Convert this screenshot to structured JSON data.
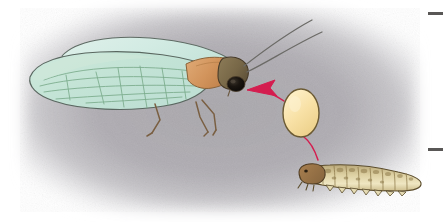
{
  "figure": {
    "kind": "scientific-illustration",
    "caption": "",
    "background": {
      "wash_color": "#aaa8ad",
      "page_color": "#ffffff",
      "shape": "soft-edged rectangular gray wash fading to white at all margins"
    },
    "margin_marks": [
      {
        "name": "upper-edge-dash",
        "x": 428,
        "y": 12,
        "width": 15,
        "height": 3,
        "color": "#3c3a38"
      },
      {
        "name": "lower-edge-dash",
        "x": 428,
        "y": 148,
        "width": 15,
        "height": 3,
        "color": "#3c3a38"
      }
    ]
  },
  "adult_insect": {
    "label": "adult caddisfly",
    "wing": {
      "fill_upper": "#d7ece6",
      "fill_lower": "#c2e3d5",
      "outline": "#5d6a63",
      "vein_color": "#7fae8c",
      "description": "two overlapping elongate pale mint-green wings held tent-like over the body, tip rounded at left"
    },
    "abdomen": {
      "fill": "#9cc0d8",
      "outline": "#6f8fa6",
      "segments": 5,
      "description": "blue-gray segmented abdomen visible through translucent wings"
    },
    "thorax": {
      "fill": "#d79a63",
      "outline": "#8a6238",
      "description": "orange-tan thorax tapering to the head"
    },
    "head": {
      "fill": "#7a6a4a",
      "outline": "#473a28",
      "eye_color": "#15100c",
      "description": "dark olive-brown head with large black compound eye"
    },
    "antennae": {
      "color": "#6b6a66",
      "count": 2,
      "description": "two long slender antennae curving up and to the right"
    },
    "legs": {
      "color": "#7a5f42",
      "count": 3,
      "description": "thin brown jointed legs hanging below the thorax"
    }
  },
  "egg": {
    "label": "egg",
    "fill": "#f7e0a4",
    "outline": "#6b5a33",
    "center_x": 301,
    "center_y": 113,
    "radius_x": 18,
    "radius_y": 24,
    "description": "cream-yellow oval egg with dark brown outline"
  },
  "larva": {
    "label": "larva",
    "body_fill": "#cfc08d",
    "body_highlight": "#efe4bc",
    "mottle_color": "#8e7a4a",
    "head_fill": "#9a7348",
    "outline": "#5b4c2c",
    "segments": 11,
    "description": "elongate segmented caddisfly larva, tan with olive-brown mottling, dark brown head at left, fleshy prolegs along the underside"
  },
  "annotation": {
    "line_color": "#d41d4f",
    "arrow_color": "#d41d4f",
    "arrow_points_to": "adult-head",
    "description": "crimson leader line from the larva up through the egg, terminating in an arrowhead pointing left at the adult's head"
  }
}
